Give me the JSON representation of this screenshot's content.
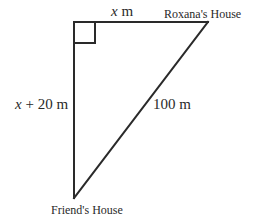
{
  "diagram": {
    "type": "right-triangle",
    "stroke_color": "#2a2a2a",
    "vertices": {
      "right_angle_corner": {
        "x": 74,
        "y": 22
      },
      "roxanas_house": {
        "x": 208,
        "y": 22
      },
      "friends_house": {
        "x": 74,
        "y": 198
      }
    },
    "right_angle_marker": {
      "size": 21
    }
  },
  "labels": {
    "top_side": {
      "var": "x",
      "unit": " m"
    },
    "left_side": {
      "var": "x",
      "rest": " + 20 m"
    },
    "hypotenuse": "100 m",
    "roxanas_house": "Roxana's House",
    "friends_house": "Friend's House"
  }
}
